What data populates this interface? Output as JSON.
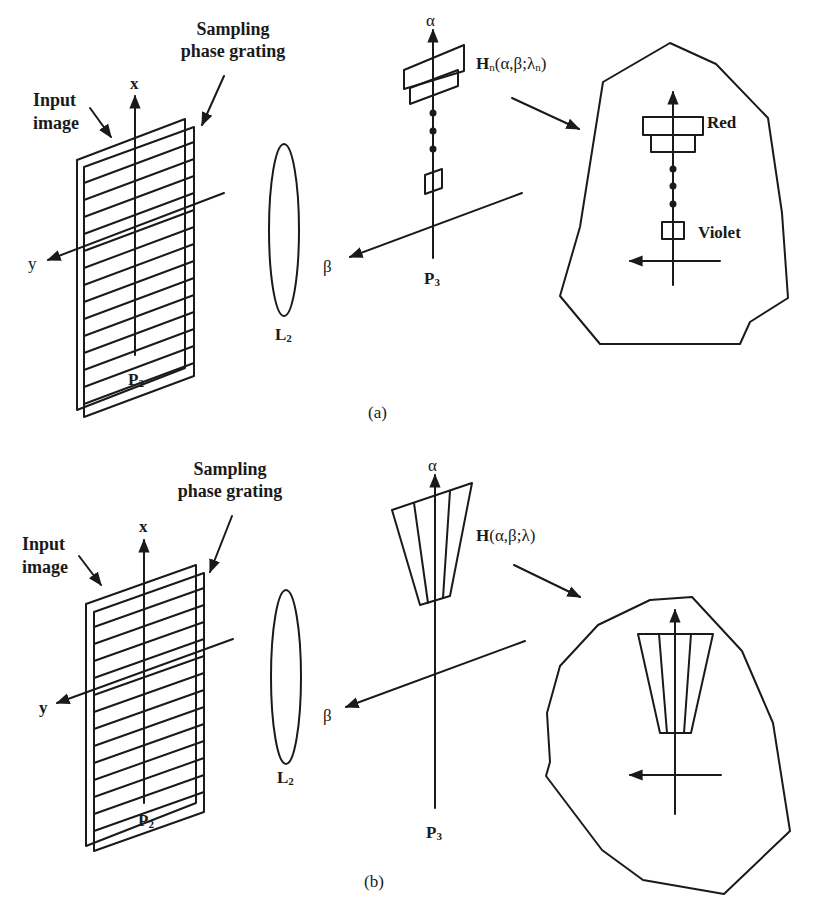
{
  "figure": {
    "panels": [
      {
        "id": "a",
        "caption": "(a)",
        "labels": {
          "input_image_line1": "Input",
          "input_image_line2": "image",
          "grating_line1": "Sampling",
          "grating_line2": "phase grating",
          "axis_x": "x",
          "axis_y": "y",
          "plane_p2": "P",
          "plane_p2_sub": "2",
          "lens": "L",
          "lens_sub": "2",
          "axis_alpha": "α",
          "axis_beta": "β",
          "plane_p3": "P",
          "plane_p3_sub": "3",
          "filter_fn": "H",
          "filter_fn_sub": "n",
          "filter_args": "(α,β;λ",
          "filter_args_sub": "n",
          "filter_args_close": ")",
          "red": "Red",
          "violet": "Violet"
        }
      },
      {
        "id": "b",
        "caption": "(b)",
        "labels": {
          "input_image_line1": "Input",
          "input_image_line2": "image",
          "grating_line1": "Sampling",
          "grating_line2": "phase grating",
          "axis_x": "x",
          "axis_y": "y",
          "plane_p2": "P",
          "plane_p2_sub": "2",
          "lens": "L",
          "lens_sub": "2",
          "axis_alpha": "α",
          "axis_beta": "β",
          "plane_p3": "P",
          "plane_p3_sub": "3",
          "filter_fn": "H",
          "filter_args": "(α,β;λ)"
        }
      }
    ]
  }
}
